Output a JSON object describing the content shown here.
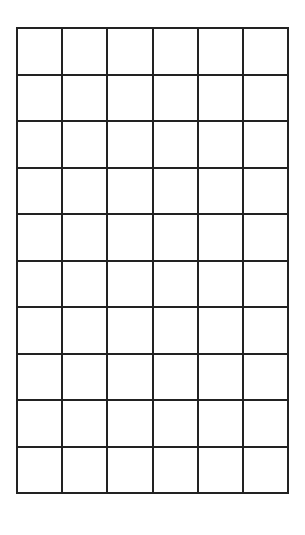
{
  "grid": {
    "columns": 6,
    "rows": 10,
    "line_color": "#222222",
    "background": "#ffffff",
    "cells": []
  }
}
